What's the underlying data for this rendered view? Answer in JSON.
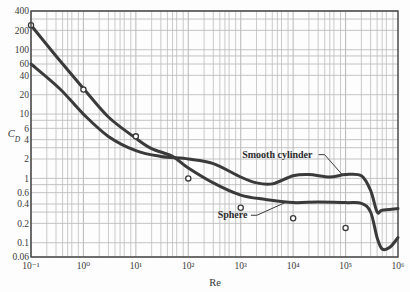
{
  "chart_data": {
    "type": "line",
    "title": "",
    "xlabel": "Re",
    "ylabel": "C_D",
    "xscale": "log",
    "yscale": "log",
    "xlim": [
      0.1,
      1000000
    ],
    "ylim": [
      0.06,
      400
    ],
    "grid": true,
    "x_ticks": [
      {
        "value": 0.1,
        "label": "10⁻¹"
      },
      {
        "value": 1,
        "label": "10⁰"
      },
      {
        "value": 10,
        "label": "10¹"
      },
      {
        "value": 100,
        "label": "10²"
      },
      {
        "value": 1000,
        "label": "10³"
      },
      {
        "value": 10000,
        "label": "10⁴"
      },
      {
        "value": 100000,
        "label": "10⁵"
      },
      {
        "value": 1000000,
        "label": "10⁶"
      }
    ],
    "y_ticks": [
      {
        "value": 400,
        "label": "400"
      },
      {
        "value": 200,
        "label": "200"
      },
      {
        "value": 100,
        "label": "100"
      },
      {
        "value": 60,
        "label": "60"
      },
      {
        "value": 40,
        "label": "40"
      },
      {
        "value": 20,
        "label": "20"
      },
      {
        "value": 10,
        "label": "10"
      },
      {
        "value": 6,
        "label": "6"
      },
      {
        "value": 4,
        "label": "4"
      },
      {
        "value": 2,
        "label": "2"
      },
      {
        "value": 1,
        "label": "1"
      },
      {
        "value": 0.6,
        "label": "0.6"
      },
      {
        "value": 0.4,
        "label": "0.4"
      },
      {
        "value": 0.2,
        "label": "0.2"
      },
      {
        "value": 0.1,
        "label": "0.1"
      },
      {
        "value": 0.06,
        "label": "0.06"
      }
    ],
    "series": [
      {
        "name": "Smooth cylinder",
        "x": [
          0.1,
          0.35,
          1,
          3,
          10,
          30,
          100,
          300,
          1000,
          2000,
          4000,
          10000,
          20000,
          50000,
          100000,
          200000,
          300000,
          400000,
          500000,
          1000000
        ],
        "y": [
          60,
          25,
          10,
          4.5,
          2.7,
          2.2,
          2.0,
          1.7,
          1.05,
          0.85,
          0.82,
          1.1,
          1.15,
          1.05,
          1.15,
          1.1,
          0.65,
          0.3,
          0.32,
          0.34
        ]
      },
      {
        "name": "Sphere",
        "x": [
          0.1,
          0.3,
          1,
          3,
          10,
          20,
          50,
          100,
          300,
          1000,
          3000,
          10000,
          30000,
          100000,
          200000,
          300000,
          400000,
          500000,
          700000,
          1000000
        ],
        "y": [
          240,
          80,
          25,
          9,
          4.2,
          2.9,
          2.2,
          1.45,
          0.85,
          0.55,
          0.47,
          0.42,
          0.43,
          0.42,
          0.41,
          0.3,
          0.12,
          0.08,
          0.085,
          0.12
        ]
      }
    ],
    "markers": {
      "name": "Sphere (Stokes 24/Re)",
      "style": "open-circle",
      "x": [
        0.1,
        1,
        10,
        100,
        1000,
        10000,
        100000
      ],
      "y": [
        240,
        24,
        4.5,
        1.0,
        0.35,
        0.24,
        0.17
      ]
    },
    "annotations": [
      {
        "text": "Smooth cylinder",
        "target_series": "Smooth cylinder",
        "label_x": 5000,
        "label_y": 2.1,
        "pointer_to_x": 90000,
        "pointer_to_y": 1.1
      },
      {
        "text": "Sphere",
        "target_series": "Sphere",
        "label_x": 700,
        "label_y": 0.24,
        "pointer_to_x": 7000,
        "pointer_to_y": 0.42
      }
    ]
  },
  "colors": {
    "curve": "#3a3a3a",
    "grid": "#bdbdbd",
    "axis": "#3c3c3c",
    "marker": "#3a3a3a",
    "background": "#fdfdfd"
  }
}
